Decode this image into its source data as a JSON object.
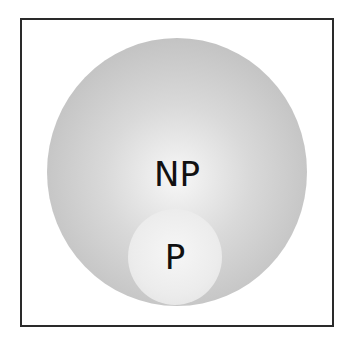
{
  "diagram": {
    "type": "nested-set-diagram",
    "outer_set": {
      "label": "NP",
      "color": "#c4c4c4"
    },
    "inner_set": {
      "label": "P",
      "color": "#ececec"
    },
    "frame_color": "#2a2a2a"
  }
}
